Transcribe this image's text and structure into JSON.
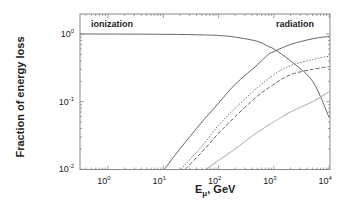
{
  "chart_data": {
    "type": "line",
    "title": "",
    "xlabel": "E_μ, GeV",
    "xlabel_main": "E",
    "xlabel_sub": "μ",
    "xlabel_rest": ", GeV",
    "ylabel": "Fraction of energy loss",
    "xscale": "log",
    "yscale": "log",
    "xlim": [
      0.3,
      10000
    ],
    "ylim": [
      0.01,
      1.5
    ],
    "grid": false,
    "x_ticks": [
      {
        "base": "10",
        "exp": "0",
        "value": 1
      },
      {
        "base": "10",
        "exp": "1",
        "value": 10
      },
      {
        "base": "10",
        "exp": "2",
        "value": 100
      },
      {
        "base": "10",
        "exp": "3",
        "value": 1000
      },
      {
        "base": "10",
        "exp": "4",
        "value": 10000
      }
    ],
    "y_ticks": [
      {
        "base": "10",
        "exp": "0",
        "value": 1
      },
      {
        "base": "10",
        "exp": "-1",
        "value": 0.1
      },
      {
        "base": "10",
        "exp": "-2",
        "value": 0.01
      }
    ],
    "annotations": [
      {
        "text": "ionization",
        "position": "top-left"
      },
      {
        "text": "radiation",
        "position": "top-right"
      }
    ],
    "series": [
      {
        "name": "ionization",
        "style": "solid",
        "color": "#555555",
        "x": [
          0.3,
          10,
          50,
          100,
          200,
          500,
          800,
          1000,
          2000,
          5000,
          10000
        ],
        "y": [
          1.0,
          0.99,
          0.97,
          0.95,
          0.9,
          0.78,
          0.65,
          0.6,
          0.4,
          0.2,
          0.058
        ]
      },
      {
        "name": "radiation (total)",
        "style": "solid",
        "color": "#555555",
        "x": [
          10.5,
          20,
          50,
          100,
          200,
          500,
          800,
          1000,
          2000,
          5000,
          10000
        ],
        "y": [
          0.01,
          0.02,
          0.05,
          0.095,
          0.18,
          0.35,
          0.5,
          0.55,
          0.7,
          0.85,
          0.92
        ]
      },
      {
        "name": "pair production",
        "style": "dotted",
        "color": "#666666",
        "x": [
          21,
          50,
          100,
          200,
          500,
          1000,
          2000,
          5000,
          10000
        ],
        "y": [
          0.01,
          0.022,
          0.045,
          0.08,
          0.16,
          0.25,
          0.34,
          0.42,
          0.47
        ]
      },
      {
        "name": "bremsstrahlung",
        "style": "dashed",
        "color": "#555555",
        "x": [
          25,
          50,
          100,
          200,
          500,
          1000,
          2000,
          5000,
          10000
        ],
        "y": [
          0.01,
          0.018,
          0.034,
          0.06,
          0.12,
          0.18,
          0.25,
          0.3,
          0.33
        ]
      },
      {
        "name": "photonuclear",
        "style": "solid-light",
        "color": "#bbbbbb",
        "x": [
          60,
          100,
          200,
          500,
          1000,
          2000,
          5000,
          10000
        ],
        "y": [
          0.01,
          0.0135,
          0.02,
          0.035,
          0.05,
          0.07,
          0.1,
          0.14
        ]
      }
    ]
  },
  "colors": {
    "axis": "#777777",
    "text": "#222222"
  }
}
